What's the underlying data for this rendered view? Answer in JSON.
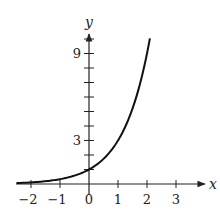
{
  "chart_data": {
    "type": "line",
    "title": "",
    "function": "y = 3^x",
    "xlabel": "x",
    "ylabel": "y",
    "xlim": [
      -2.5,
      3.8
    ],
    "ylim": [
      0,
      10.8
    ],
    "x_ticks": [
      -2,
      -1,
      0,
      1,
      2,
      3
    ],
    "x_tick_labels": [
      "−2",
      "−1",
      "0",
      "1",
      "2",
      "3"
    ],
    "y_ticks": [
      1,
      2,
      3,
      4,
      5,
      6,
      7,
      8,
      9,
      10
    ],
    "y_tick_labels": [
      {
        "value": 3,
        "label": "3"
      },
      {
        "value": 9,
        "label": "9"
      }
    ],
    "grid": false,
    "legend": null,
    "series": [
      {
        "name": "y = 3^x",
        "color": "#111111",
        "x": [
          -2.5,
          -2,
          -1.5,
          -1,
          -0.5,
          0,
          0.5,
          1,
          1.5,
          2,
          2.1
        ],
        "y": [
          0.06,
          0.11,
          0.19,
          0.33,
          0.58,
          1,
          1.73,
          3,
          5.2,
          9,
          10.05
        ]
      }
    ]
  },
  "axes": {
    "x_label": "x",
    "y_label": "y"
  }
}
